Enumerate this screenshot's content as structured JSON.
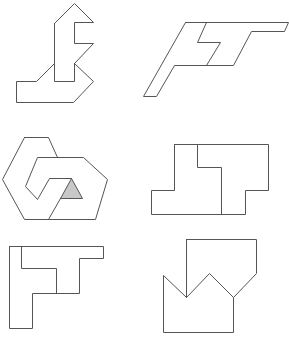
{
  "figure": {
    "width": 289,
    "height": 340,
    "background": "#ffffff",
    "stroke_color": "#555555",
    "highlight_fill": "#c8c8c8"
  },
  "shapes": [
    {
      "name": "shape-1-arrow-hook",
      "polylines": [
        [
          [
            54,
            23
          ],
          [
            74,
            3
          ],
          [
            93,
            22
          ],
          [
            74,
            22
          ],
          [
            74,
            43
          ],
          [
            93,
            43
          ],
          [
            74,
            63
          ],
          [
            93,
            81
          ],
          [
            73,
            102
          ],
          [
            16,
            102
          ],
          [
            16,
            81
          ],
          [
            36,
            81
          ],
          [
            54,
            63
          ],
          [
            54,
            23
          ]
        ],
        [
          [
            54,
            63
          ],
          [
            54,
            81
          ],
          [
            74,
            81
          ],
          [
            74,
            63
          ]
        ]
      ],
      "filled": []
    },
    {
      "name": "shape-2-slanted-ft",
      "polylines": [
        [
          [
            185,
            22
          ],
          [
            288,
            22
          ],
          [
            284,
            31
          ],
          [
            251,
            31
          ],
          [
            233,
            65
          ],
          [
            174,
            65
          ],
          [
            156,
            96
          ],
          [
            143,
            96
          ],
          [
            185,
            22
          ]
        ],
        [
          [
            206,
            22
          ],
          [
            197,
            42
          ],
          [
            220,
            42
          ],
          [
            206,
            65
          ]
        ]
      ],
      "filled": []
    },
    {
      "name": "shape-3-interlocked-hexagons",
      "polylines": [
        [
          [
            24,
            137
          ],
          [
            48,
            137
          ],
          [
            57,
            157
          ],
          [
            37,
            157
          ],
          [
            25,
            186
          ],
          [
            37,
            199
          ],
          [
            49,
            178
          ],
          [
            71,
            178
          ]
        ],
        [
          [
            24,
            137
          ],
          [
            2,
            179
          ],
          [
            24,
            219
          ],
          [
            48,
            219
          ],
          [
            95,
            219
          ],
          [
            107,
            179
          ],
          [
            83,
            157
          ],
          [
            57,
            157
          ]
        ],
        [
          [
            48,
            219
          ],
          [
            60,
            198
          ]
        ]
      ],
      "filled": [
        [
          [
            71,
            178
          ],
          [
            60,
            198
          ],
          [
            82,
            198
          ]
        ]
      ]
    },
    {
      "name": "shape-4-interlocked-blocks",
      "polylines": [
        [
          [
            174,
            144
          ],
          [
            268,
            144
          ],
          [
            268,
            190
          ],
          [
            245,
            190
          ],
          [
            245,
            214
          ],
          [
            151,
            214
          ],
          [
            151,
            190
          ],
          [
            174,
            190
          ],
          [
            174,
            144
          ]
        ],
        [
          [
            197,
            144
          ],
          [
            197,
            167
          ],
          [
            221,
            167
          ],
          [
            221,
            214
          ]
        ]
      ],
      "filled": []
    },
    {
      "name": "shape-5-corner-ft",
      "polylines": [
        [
          [
            9,
            246
          ],
          [
            103,
            246
          ],
          [
            103,
            258
          ],
          [
            79,
            258
          ],
          [
            79,
            293
          ],
          [
            32,
            293
          ],
          [
            32,
            328
          ],
          [
            9,
            328
          ],
          [
            9,
            246
          ]
        ],
        [
          [
            21,
            246
          ],
          [
            21,
            268
          ],
          [
            56,
            268
          ],
          [
            56,
            293
          ]
        ]
      ],
      "filled": []
    },
    {
      "name": "shape-6-crown-pentagon",
      "polylines": [
        [
          [
            186,
            239
          ],
          [
            256,
            239
          ],
          [
            256,
            273
          ],
          [
            233,
            297
          ],
          [
            233,
            332
          ],
          [
            163,
            332
          ],
          [
            163,
            275
          ],
          [
            186,
            297
          ],
          [
            209,
            273
          ],
          [
            233,
            297
          ]
        ],
        [
          [
            186,
            239
          ],
          [
            186,
            297
          ]
        ]
      ],
      "filled": []
    }
  ]
}
